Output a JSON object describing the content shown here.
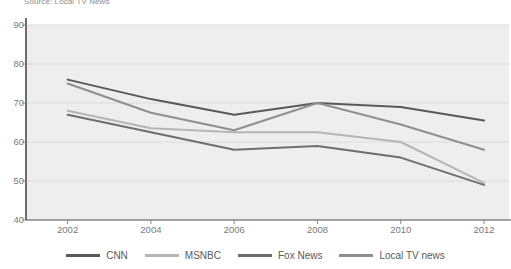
{
  "source_note": "Source: Local TV News",
  "chart_data": {
    "type": "line",
    "title": "",
    "subtitle": "",
    "xlabel": "",
    "ylabel": "",
    "x": [
      2002,
      2004,
      2006,
      2008,
      2010,
      2012
    ],
    "categories": [
      "2002",
      "2004",
      "2006",
      "2008",
      "2010",
      "2012"
    ],
    "xlim": [
      2001,
      2012.6
    ],
    "ylim": [
      40,
      90
    ],
    "yticks": [
      40,
      50,
      60,
      70,
      80,
      90
    ],
    "ytick_labels": [
      "40",
      "50",
      "60",
      "70",
      "80",
      "90"
    ],
    "xticks": [
      2002,
      2004,
      2006,
      2008,
      2010,
      2012
    ],
    "xtick_labels": [
      "2002",
      "2004",
      "2006",
      "2008",
      "2010",
      "2012"
    ],
    "grid": true,
    "grid_axis": "y",
    "legend_position": "bottom",
    "plot_background": "#eeeeee",
    "series": [
      {
        "name": "CNN",
        "color": "#595959",
        "values": [
          76,
          71,
          67,
          70,
          69,
          65.5
        ]
      },
      {
        "name": "MSNBC",
        "color": "#b5b5b5",
        "values": [
          68,
          63.5,
          62.5,
          62.5,
          60,
          49.5
        ]
      },
      {
        "name": "Fox News",
        "color": "#6e6e6e",
        "values": [
          67,
          62.5,
          58,
          59,
          56,
          49
        ]
      },
      {
        "name": "Local TV news",
        "color": "#8f8f8f",
        "values": [
          75,
          67.5,
          63,
          70,
          64.5,
          58
        ]
      }
    ]
  },
  "legend": {
    "items": [
      {
        "label": "CNN",
        "color": "#595959"
      },
      {
        "label": "MSNBC",
        "color": "#b5b5b5"
      },
      {
        "label": "Fox News",
        "color": "#6e6e6e"
      },
      {
        "label": "Local TV news",
        "color": "#8f8f8f"
      }
    ]
  },
  "axis": {
    "y_axis_line_color": "#4a4a4a",
    "x_axis_line_color": "#4a4a4a"
  }
}
